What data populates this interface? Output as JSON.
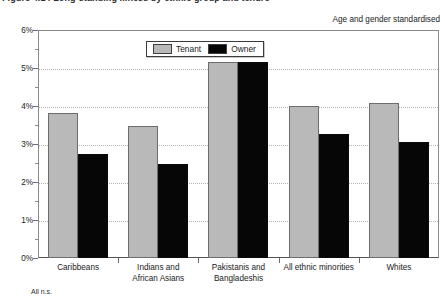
{
  "figure": {
    "caption": "Figure 4.14  Long-standing illness by ethnic group and tenure",
    "note": "Age and gender standardised",
    "footnote": "All n.s."
  },
  "legend": {
    "position": "top-center",
    "entries": [
      {
        "label": "Tenant",
        "color": "#b9b9b9",
        "icon": "legend-swatch-tenant"
      },
      {
        "label": "Owner",
        "color": "#060606",
        "icon": "legend-swatch-owner"
      }
    ]
  },
  "axes": {
    "y": {
      "ticks": [
        "0%",
        "1%",
        "2%",
        "3%",
        "4%",
        "5%",
        "6%"
      ],
      "min": 0,
      "max": 6,
      "minor_step": 0.5
    }
  },
  "chart_data": {
    "type": "bar",
    "title": "Figure 4.14  Long-standing illness by ethnic group and tenure",
    "subtitle": "Age and gender standardised",
    "xlabel": "",
    "ylabel": "",
    "ylim": [
      0,
      6
    ],
    "ytick_labels": [
      "0%",
      "1%",
      "2%",
      "3%",
      "4%",
      "5%",
      "6%"
    ],
    "grid": true,
    "legend_position": "top-center",
    "annotations": [
      "All n.s."
    ],
    "categories": [
      "Caribbeans",
      "Indians and African Asians",
      "Pakistanis and Bangladeshis",
      "All ethnic minorities",
      "Whites"
    ],
    "category_lines": [
      [
        "Caribbeans"
      ],
      [
        "Indians and",
        "African Asians"
      ],
      [
        "Pakistanis and",
        "Bangladeshis"
      ],
      [
        "All ethnic minorities"
      ],
      [
        "Whites"
      ]
    ],
    "series": [
      {
        "name": "Tenant",
        "color": "#b9b9b9",
        "values": [
          3.82,
          3.48,
          5.15,
          4.0,
          4.07
        ]
      },
      {
        "name": "Owner",
        "color": "#060606",
        "values": [
          2.73,
          2.47,
          5.15,
          3.27,
          3.05
        ]
      }
    ]
  }
}
